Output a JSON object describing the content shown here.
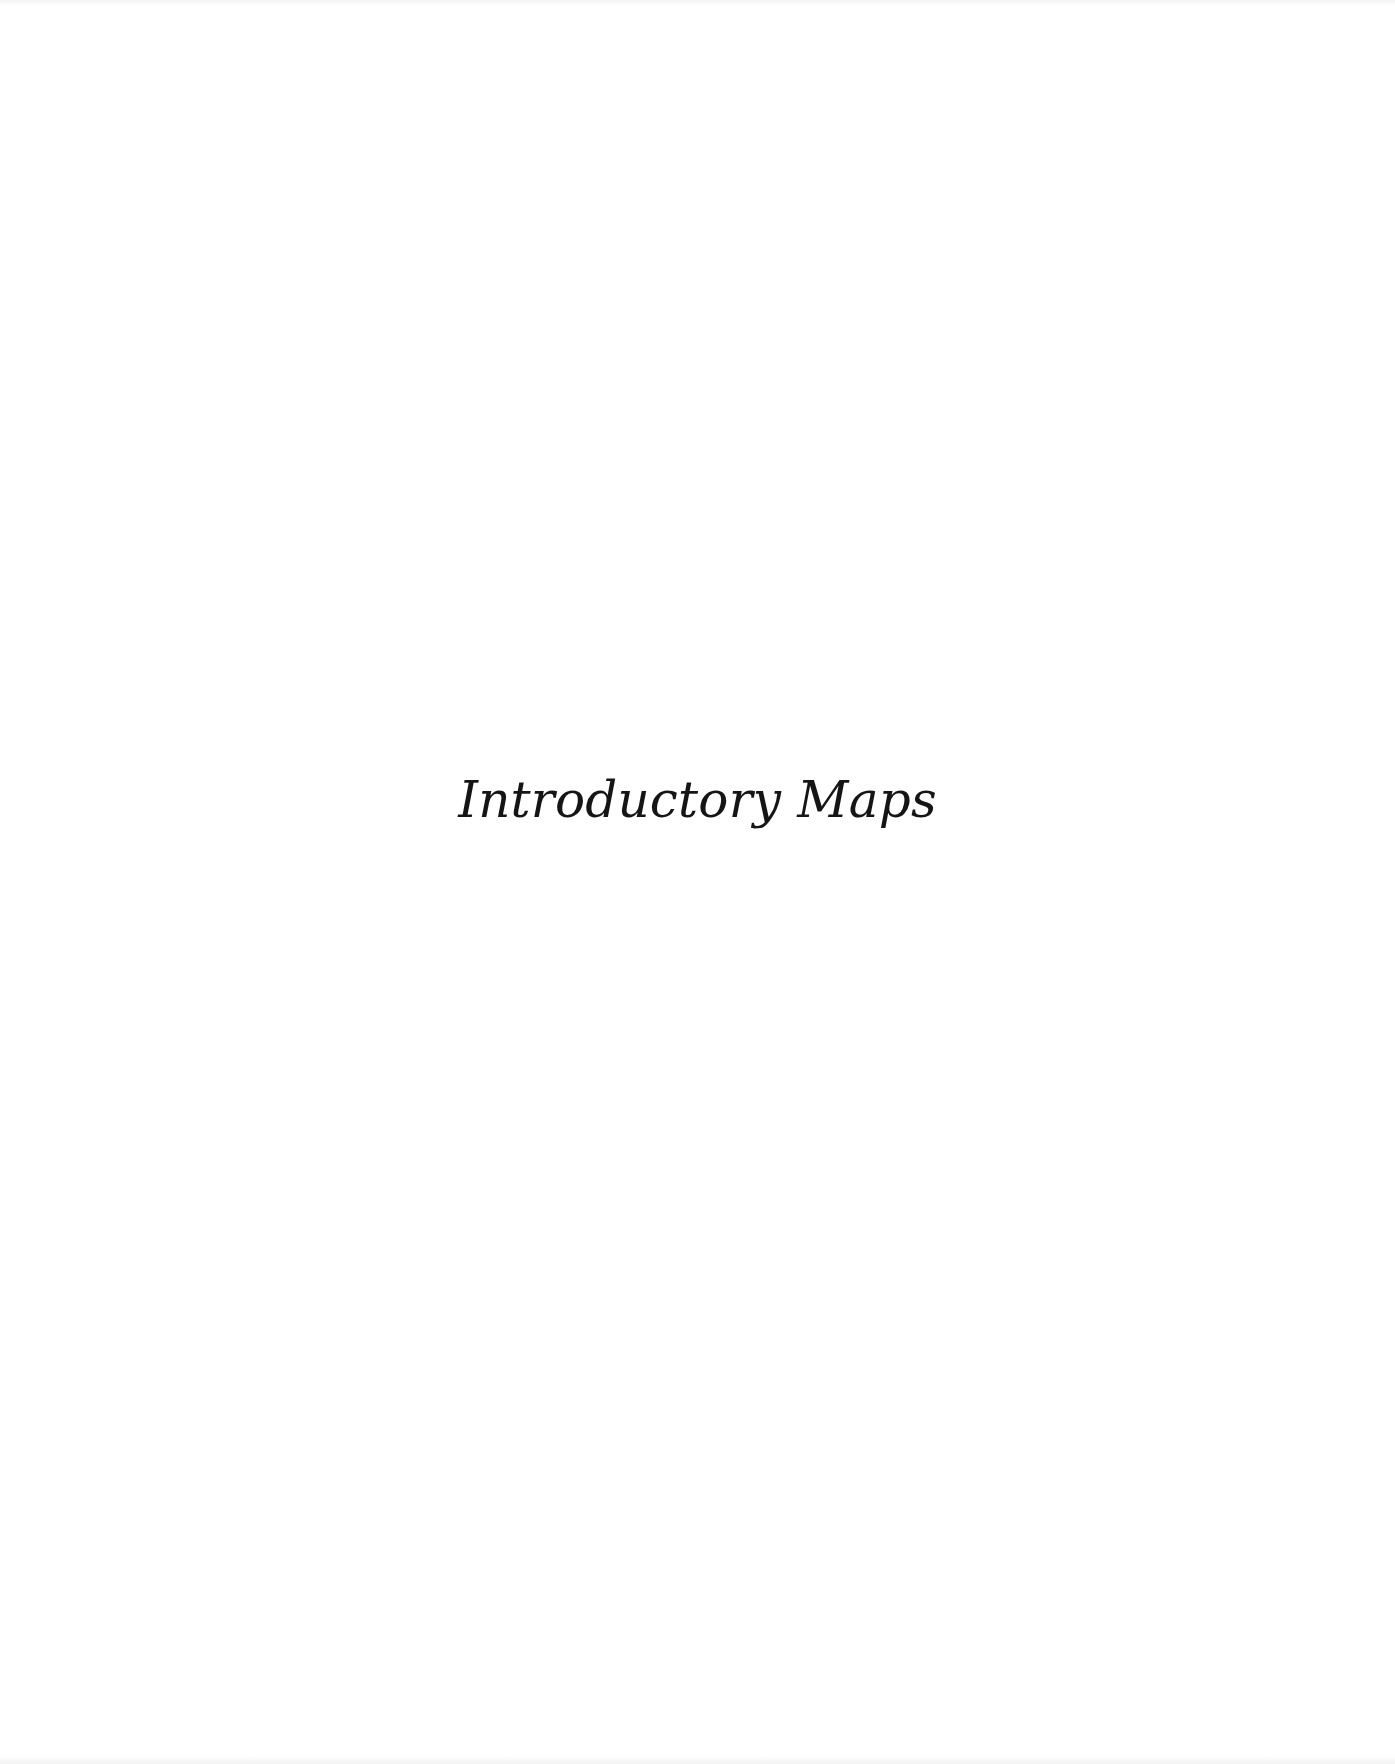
{
  "page": {
    "title": "Introductory Maps"
  }
}
